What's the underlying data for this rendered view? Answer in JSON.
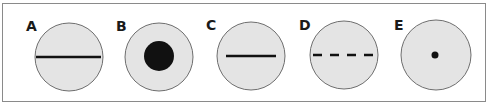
{
  "figure": {
    "colors": {
      "circle_fill": "#e4e4e4",
      "circle_stroke": "#6e6e6e",
      "mark": "#111111",
      "frame": "#8a8a8a"
    },
    "panels": [
      {
        "label": "A",
        "pattern": "long-solid-line"
      },
      {
        "label": "B",
        "pattern": "large-filled-dot"
      },
      {
        "label": "C",
        "pattern": "short-solid-line"
      },
      {
        "label": "D",
        "pattern": "dashed-line"
      },
      {
        "label": "E",
        "pattern": "small-dot"
      }
    ]
  }
}
